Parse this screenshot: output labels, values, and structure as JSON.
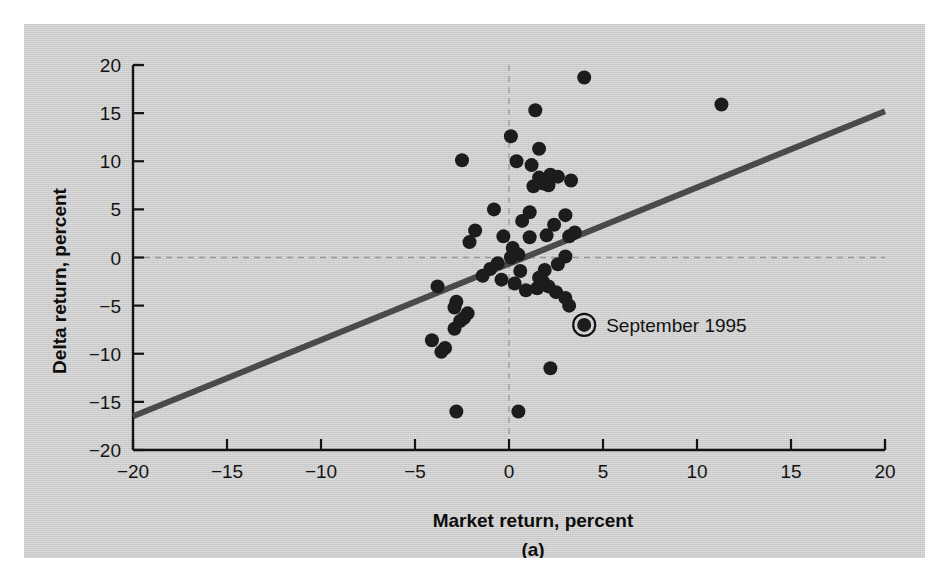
{
  "figure": {
    "panel_caption": "(a)",
    "background_color": "#cdcdcd",
    "point_color": "#1c1c1c",
    "line_color": "#4a4a4a"
  },
  "chart_data": {
    "type": "scatter",
    "title": "",
    "subtitle": "",
    "xlabel": "Market return, percent",
    "ylabel": "Delta return, percent",
    "xlim": [
      -20,
      20
    ],
    "ylim": [
      -20,
      20
    ],
    "xticks": [
      -20,
      -15,
      -10,
      -5,
      0,
      5,
      10,
      15,
      20
    ],
    "xtick_labels": [
      "−20",
      "−15",
      "−10",
      "−5",
      "0",
      "5",
      "10",
      "15",
      "20"
    ],
    "yticks": [
      -20,
      -15,
      -10,
      -5,
      0,
      5,
      10,
      15,
      20
    ],
    "ytick_labels": [
      "−20",
      "−15",
      "−10",
      "−5",
      "0",
      "5",
      "10",
      "15",
      "20"
    ],
    "grid": false,
    "reference_lines": [
      {
        "name": "zero-horizontal",
        "axis": "y",
        "value": 0,
        "style": "dashed"
      },
      {
        "name": "zero-vertical",
        "axis": "x",
        "value": 0,
        "style": "dashed"
      }
    ],
    "fit_line": {
      "name": "regression-line",
      "x_start": -20,
      "y_start": -16.5,
      "x_end": 20,
      "y_end": 15.2,
      "slope": 0.79,
      "intercept": -0.65
    },
    "annotations": [
      {
        "name": "september-1995",
        "label": "September 1995",
        "x": 4.0,
        "y": -7.0,
        "marker": "circled-point"
      }
    ],
    "points": [
      {
        "x": 4.0,
        "y": 18.7
      },
      {
        "x": 11.3,
        "y": 15.9
      },
      {
        "x": 1.4,
        "y": 15.3
      },
      {
        "x": 0.1,
        "y": 12.6
      },
      {
        "x": 1.6,
        "y": 11.3
      },
      {
        "x": -2.5,
        "y": 10.1
      },
      {
        "x": 0.4,
        "y": 10.0
      },
      {
        "x": 1.2,
        "y": 9.6
      },
      {
        "x": 2.2,
        "y": 8.6
      },
      {
        "x": 1.6,
        "y": 8.3
      },
      {
        "x": 2.6,
        "y": 8.4
      },
      {
        "x": 3.3,
        "y": 8.0
      },
      {
        "x": 1.8,
        "y": 7.7
      },
      {
        "x": 2.1,
        "y": 7.5
      },
      {
        "x": 1.3,
        "y": 7.4
      },
      {
        "x": -0.8,
        "y": 5.0
      },
      {
        "x": 1.1,
        "y": 4.7
      },
      {
        "x": 3.0,
        "y": 4.4
      },
      {
        "x": 0.7,
        "y": 3.8
      },
      {
        "x": 2.4,
        "y": 3.4
      },
      {
        "x": -1.8,
        "y": 2.8
      },
      {
        "x": -0.3,
        "y": 2.2
      },
      {
        "x": 1.1,
        "y": 2.1
      },
      {
        "x": 2.0,
        "y": 2.3
      },
      {
        "x": 3.2,
        "y": 2.2
      },
      {
        "x": 3.5,
        "y": 2.6
      },
      {
        "x": -2.1,
        "y": 1.6
      },
      {
        "x": 0.2,
        "y": 1.0
      },
      {
        "x": 0.5,
        "y": 0.3
      },
      {
        "x": 0.1,
        "y": 0.0
      },
      {
        "x": 3.0,
        "y": 0.1
      },
      {
        "x": -0.6,
        "y": -0.6
      },
      {
        "x": 2.6,
        "y": -0.7
      },
      {
        "x": -1.0,
        "y": -1.2
      },
      {
        "x": 0.6,
        "y": -1.4
      },
      {
        "x": 1.9,
        "y": -1.3
      },
      {
        "x": -1.4,
        "y": -1.9
      },
      {
        "x": -0.4,
        "y": -2.3
      },
      {
        "x": 1.6,
        "y": -2.1
      },
      {
        "x": 1.8,
        "y": -2.5
      },
      {
        "x": 0.3,
        "y": -2.7
      },
      {
        "x": -3.8,
        "y": -3.0
      },
      {
        "x": 1.5,
        "y": -3.2
      },
      {
        "x": 2.1,
        "y": -3.0
      },
      {
        "x": 0.9,
        "y": -3.4
      },
      {
        "x": 2.5,
        "y": -3.6
      },
      {
        "x": 3.0,
        "y": -4.2
      },
      {
        "x": -2.8,
        "y": -4.6
      },
      {
        "x": -2.9,
        "y": -5.2
      },
      {
        "x": 3.2,
        "y": -5.0
      },
      {
        "x": -2.2,
        "y": -5.8
      },
      {
        "x": -2.4,
        "y": -6.3
      },
      {
        "x": -2.6,
        "y": -6.6
      },
      {
        "x": 4.0,
        "y": -7.0
      },
      {
        "x": -2.9,
        "y": -7.4
      },
      {
        "x": -4.1,
        "y": -8.6
      },
      {
        "x": -3.4,
        "y": -9.4
      },
      {
        "x": -3.6,
        "y": -9.8
      },
      {
        "x": 2.2,
        "y": -11.5
      },
      {
        "x": -2.8,
        "y": -16.0
      },
      {
        "x": 0.5,
        "y": -16.0
      }
    ]
  }
}
